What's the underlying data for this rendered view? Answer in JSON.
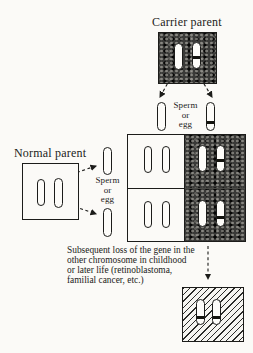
{
  "labels": {
    "carrier_parent": "Carrier parent",
    "normal_parent": "Normal parent"
  },
  "gametes": {
    "carrier": {
      "l1": "Sperm",
      "l2": "or",
      "l3": "egg"
    },
    "normal": {
      "l1": "Sperm",
      "l2": "or",
      "l3": "egg"
    }
  },
  "caption": {
    "l1": "Subsequent loss of the gene in the",
    "l2": "other chromosome in childhood",
    "l3": "or  later life (retinoblastoma,",
    "l4": "familial cancer, etc.)"
  },
  "colors": {
    "paper": "#fbfaf7",
    "ink": "#1c1c1a",
    "shaded_cell": "#3a3a38",
    "chromosome_fill": "#fdfcf9",
    "mutation_band": "#14140f"
  }
}
